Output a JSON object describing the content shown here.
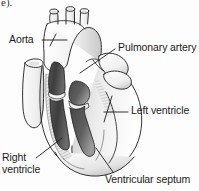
{
  "figure": {
    "page_fragment": "e).",
    "background_color": "#fdfdfd",
    "ink_color": "#1b1b1b",
    "label_font_size_px": 10.5
  },
  "labels": [
    {
      "id": "aorta",
      "text": "Aorta",
      "lines": [
        "Aorta"
      ],
      "x": 9,
      "y": 34,
      "leader": "horizontal line pointing right to aortic arch"
    },
    {
      "id": "pulmonary-artery",
      "text": "Pulmonary artery",
      "lines": [
        "Pulmonary artery"
      ],
      "x": 118,
      "y": 42,
      "leader": "diagonal line pointing down-left to pulmonary trunk"
    },
    {
      "id": "left-ventricle",
      "text": "Left ventricle",
      "lines": [
        "Left ventricle"
      ],
      "x": 131,
      "y": 105,
      "leader": "horizontal line pointing left to left ventricle wall"
    },
    {
      "id": "right-ventricle",
      "text": "Right ventricle",
      "lines": [
        "Right",
        "ventricle"
      ],
      "line_1": "Right",
      "line_2": "ventricle",
      "x": 2,
      "y": 152,
      "leader": "diagonal line pointing up-right into right ventricle cavity"
    },
    {
      "id": "ventricular-septum",
      "text": "Ventricular septum",
      "lines": [
        "Ventricular septum"
      ],
      "x": 105,
      "y": 174,
      "leader": "diagonal line pointing up-left to the septum"
    }
  ],
  "anatomy_parts": [
    {
      "id": "aortic-arch",
      "name": "Aortic arch"
    },
    {
      "id": "brachiocephalic-stump",
      "name": "Brachiocephalic trunk stump"
    },
    {
      "id": "carotid-stump",
      "name": "Left common carotid stump"
    },
    {
      "id": "subclavian-stump",
      "name": "Left subclavian stump"
    },
    {
      "id": "superior-vena-cava",
      "name": "Superior vena cava"
    },
    {
      "id": "pulmonary-trunk",
      "name": "Pulmonary trunk"
    },
    {
      "id": "right-ventricle-cavity",
      "name": "Right ventricle cavity"
    },
    {
      "id": "left-ventricle-cavity",
      "name": "Left ventricle cavity"
    },
    {
      "id": "ventricular-septum-body",
      "name": "Ventricular septum"
    },
    {
      "id": "heart-apex",
      "name": "Apex of heart"
    }
  ],
  "colors": {
    "outline": "#1b1b1b",
    "paper": "#fdfdfd",
    "cavity_dark": "#3f3f3f",
    "cavity_mid": "#6e6e6e",
    "muscle_light": "#e2e2e2",
    "muscle_mid": "#bdbdbd",
    "muscle_shadow": "#9a9a9a",
    "hatch": "#8c8c8c",
    "valve_light": "#f2f2f2"
  }
}
